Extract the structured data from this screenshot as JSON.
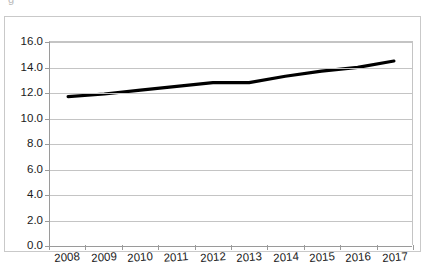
{
  "figure": {
    "clipped_top_text": "g",
    "background_color": "#ffffff",
    "frame_color": "#c9c9c9"
  },
  "chart_data": {
    "type": "line",
    "title": "",
    "subtitle": "",
    "xlabel": "",
    "ylabel": "",
    "categories": [
      "2008",
      "2009",
      "2010",
      "2011",
      "2012",
      "2013",
      "2014",
      "2015",
      "2016",
      "2017"
    ],
    "values": [
      11.7,
      11.9,
      12.2,
      12.5,
      12.8,
      12.8,
      13.3,
      13.7,
      14.0,
      14.5
    ],
    "series": [
      {
        "name": "",
        "values": [
          11.7,
          11.9,
          12.2,
          12.5,
          12.8,
          12.8,
          13.3,
          13.7,
          14.0,
          14.5
        ],
        "color": "#000000",
        "line_width": 3,
        "markers": false
      }
    ],
    "ylim": [
      0.0,
      16.0
    ],
    "ytick_step": 2.0,
    "ytick_labels": [
      "16.0",
      "14.0",
      "12.0",
      "10.0",
      "8.0",
      "6.0",
      "4.0",
      "2.0",
      "0.0"
    ],
    "ytick_values": [
      16.0,
      14.0,
      12.0,
      10.0,
      8.0,
      6.0,
      4.0,
      2.0,
      0.0
    ],
    "xtick_labels": [
      "2008",
      "2009",
      "2010",
      "2011",
      "2012",
      "2013",
      "2014",
      "2015",
      "2016",
      "2017"
    ],
    "grid": {
      "horizontal": true,
      "vertical": false,
      "color": "#c4c4c4"
    },
    "legend": {
      "visible": false,
      "position": "none",
      "entries": []
    },
    "annotations": []
  }
}
